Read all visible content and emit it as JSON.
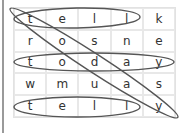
{
  "puzzle": {
    "grid": [
      [
        "t",
        "e",
        "l",
        "l",
        "k"
      ],
      [
        "r",
        "o",
        "s",
        "n",
        "e"
      ],
      [
        "t",
        "o",
        "d",
        "a",
        "y"
      ],
      [
        "w",
        "m",
        "u",
        "a",
        "s"
      ],
      [
        "t",
        "e",
        "l",
        "l",
        "y"
      ]
    ],
    "found_words": [
      {
        "word": "tell",
        "direction": "row 1 horizontal"
      },
      {
        "word": "today",
        "direction": "row 3 horizontal"
      },
      {
        "word": "telly",
        "direction": "row 5 horizontal"
      },
      {
        "word": "today",
        "direction": "diagonal top-left to bottom-right"
      }
    ],
    "oval_color": "#555555"
  }
}
